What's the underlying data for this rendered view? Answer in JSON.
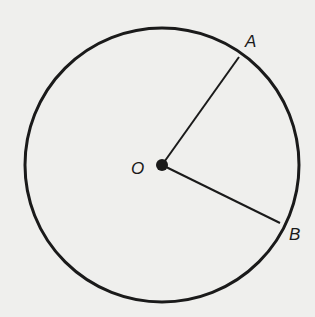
{
  "diagram": {
    "type": "circle-with-radii",
    "background": "#efefed",
    "stroke_color": "#1a1a1a",
    "circle": {
      "cx": 162,
      "cy": 165,
      "r": 137,
      "stroke_width": 3
    },
    "center": {
      "label": "O",
      "x": 162,
      "y": 165,
      "dot_r": 6,
      "label_x": 131,
      "label_y": 174
    },
    "points": [
      {
        "label": "A",
        "x": 239,
        "y": 57,
        "label_x": 245,
        "label_y": 47
      },
      {
        "label": "B",
        "x": 280,
        "y": 223,
        "label_x": 289,
        "label_y": 240
      }
    ],
    "segments": [
      {
        "name": "radius-OA",
        "from": "O",
        "to": "A"
      },
      {
        "name": "radius-OB",
        "from": "O",
        "to": "B"
      }
    ]
  }
}
